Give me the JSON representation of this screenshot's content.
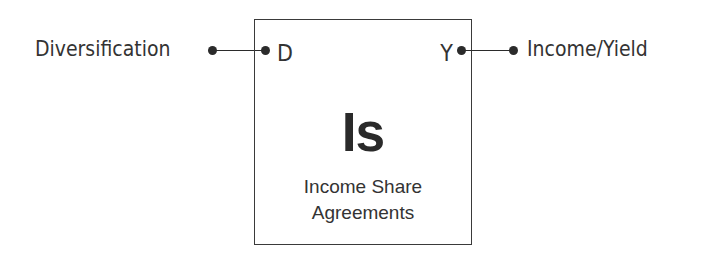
{
  "element": {
    "symbol": "Is",
    "name_line1": "Income Share",
    "name_line2": "Agreements"
  },
  "inputs": [
    {
      "port": "D",
      "label": "Diversification"
    }
  ],
  "outputs": [
    {
      "port": "Y",
      "label": "Income/Yield"
    }
  ]
}
